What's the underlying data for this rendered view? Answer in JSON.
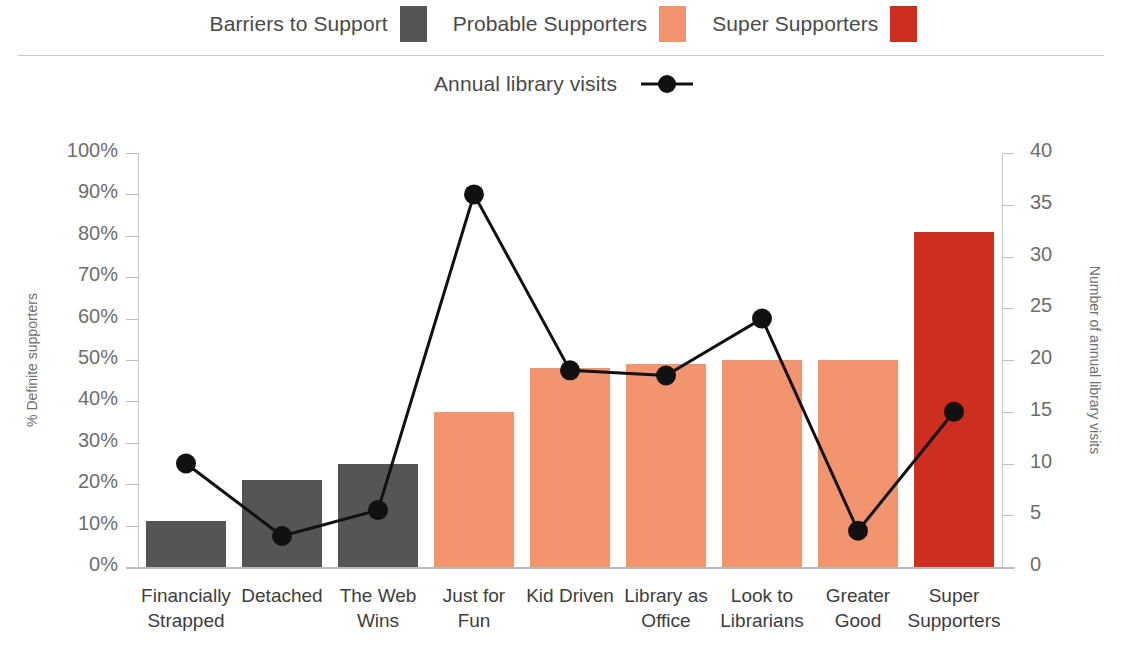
{
  "legend": {
    "row1": [
      {
        "label": "Barriers to Support",
        "swatch": "#555555",
        "icon": "legend-swatch-gray"
      },
      {
        "label": "Probable Supporters",
        "swatch": "#F2946E",
        "icon": "legend-swatch-orange"
      },
      {
        "label": "Super Supporters",
        "swatch": "#CC2E1F",
        "icon": "legend-swatch-red"
      }
    ],
    "row2": {
      "label": "Annual library visits",
      "marker": "line-with-dot-marker",
      "color": "#111111"
    }
  },
  "chart_data": {
    "type": "bar",
    "title": "",
    "subtitle": "",
    "xlabel": "",
    "ylabel": "% Definite supporters",
    "y2label": "Number of annual library visits",
    "ylim": [
      0,
      100
    ],
    "y2lim": [
      0,
      40
    ],
    "yticks": [
      "0%",
      "10%",
      "20%",
      "30%",
      "40%",
      "50%",
      "60%",
      "70%",
      "80%",
      "90%",
      "100%"
    ],
    "y2ticks": [
      "0",
      "5",
      "10",
      "15",
      "20",
      "25",
      "30",
      "35",
      "40"
    ],
    "grid": false,
    "legend_position": "top",
    "categories": [
      "Financially Strapped",
      "Detached",
      "The Web Wins",
      "Just for Fun",
      "Kid Driven",
      "Library as Office",
      "Look to Librarians",
      "Greater Good",
      "Super Supporters"
    ],
    "series": [
      {
        "name": "% Definite supporters",
        "type": "bar",
        "axis": "left",
        "values": [
          11,
          21,
          25,
          37.5,
          48,
          49,
          50,
          50,
          81
        ],
        "colors": [
          "#555555",
          "#555555",
          "#555555",
          "#F2946E",
          "#F2946E",
          "#F2946E",
          "#F2946E",
          "#F2946E",
          "#CC2E1F"
        ],
        "group_labels": [
          "Barriers to Support",
          "Barriers to Support",
          "Barriers to Support",
          "Probable Supporters",
          "Probable Supporters",
          "Probable Supporters",
          "Probable Supporters",
          "Probable Supporters",
          "Super Supporters"
        ]
      },
      {
        "name": "Annual library visits",
        "type": "line",
        "axis": "right",
        "color": "#111111",
        "values": [
          10,
          3,
          5.5,
          36,
          19,
          18.5,
          24,
          3.5,
          15
        ]
      }
    ]
  }
}
